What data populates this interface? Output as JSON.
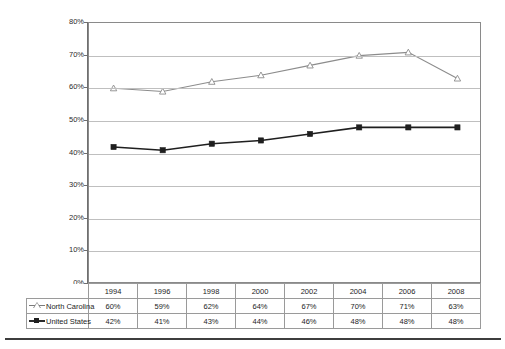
{
  "chart_data": {
    "type": "line",
    "title": "",
    "subtitle": "",
    "xlabel": "",
    "ylabel": "",
    "ylim": [
      0,
      80
    ],
    "yticks": [
      "0%",
      "10%",
      "20%",
      "30%",
      "40%",
      "50%",
      "60%",
      "70%",
      "80%"
    ],
    "ytick_values": [
      0,
      10,
      20,
      30,
      40,
      50,
      60,
      70,
      80
    ],
    "grid": true,
    "legend_position": "table-left",
    "categories": [
      "1994",
      "1996",
      "1998",
      "2000",
      "2002",
      "2004",
      "2006",
      "2008"
    ],
    "series": [
      {
        "name": "North Carolina",
        "marker": "open-triangle",
        "color": "#8c8c8c",
        "values": [
          60,
          59,
          62,
          64,
          67,
          70,
          71,
          63
        ],
        "labels": [
          "60%",
          "59%",
          "62%",
          "64%",
          "67%",
          "70%",
          "71%",
          "63%"
        ]
      },
      {
        "name": "United States",
        "marker": "filled-square",
        "color": "#1f1f1f",
        "values": [
          42,
          41,
          43,
          44,
          46,
          48,
          48,
          48
        ],
        "labels": [
          "42%",
          "41%",
          "43%",
          "44%",
          "46%",
          "48%",
          "48%",
          "48%"
        ]
      }
    ]
  },
  "table": {
    "header_blank_label": "",
    "year_headers": [
      "1994",
      "1996",
      "1998",
      "2000",
      "2002",
      "2004",
      "2006",
      "2008"
    ],
    "rows": [
      {
        "legend_label": "North Carolina",
        "marker_name": "open-triangle-marker",
        "values": [
          "60%",
          "59%",
          "62%",
          "64%",
          "67%",
          "70%",
          "71%",
          "63%"
        ]
      },
      {
        "legend_label": "United States",
        "marker_name": "filled-square-marker",
        "values": [
          "42%",
          "41%",
          "43%",
          "44%",
          "46%",
          "48%",
          "48%",
          "48%"
        ]
      }
    ]
  },
  "colors": {
    "north_carolina_line": "#8c8c8c",
    "united_states_line": "#1f1f1f",
    "gridline": "#bfbfbf",
    "axis": "#6f6f6f",
    "plot_border": "#8a8a8a",
    "table_border": "#9a9a9a",
    "rule": "#3d3d3d"
  }
}
